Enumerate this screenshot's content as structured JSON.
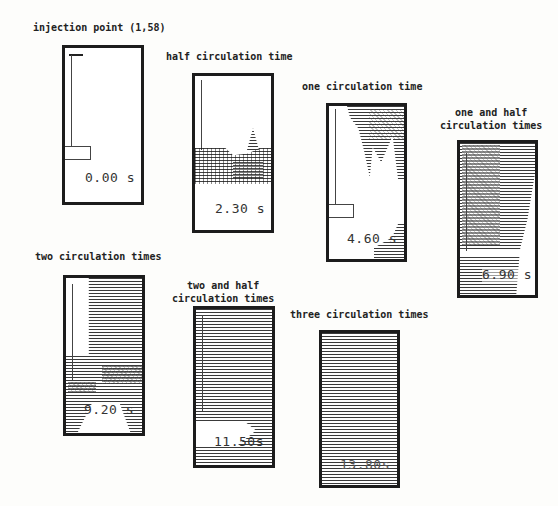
{
  "figure": {
    "type": "time-sequence of tracer dispersion in a vessel",
    "panels": [
      {
        "id": "p0",
        "label": "injection point (1,58)",
        "time": "0.00 s",
        "time_value_s": 0.0,
        "fill_state": "empty"
      },
      {
        "id": "p1",
        "label": "half circulation time",
        "time": "2.30 s",
        "time_value_s": 2.3,
        "fill_state": "lower-middle band"
      },
      {
        "id": "p2",
        "label": "one circulation time",
        "time": "4.60 s",
        "time_value_s": 4.6,
        "fill_state": "upper-right plume and lower-right corner"
      },
      {
        "id": "p3",
        "label": "one and half\ncirculation times",
        "time": "6.90 s",
        "time_value_s": 6.9,
        "fill_state": "mostly filled"
      },
      {
        "id": "p4",
        "label": "two circulation times",
        "time": "9.20 s",
        "time_value_s": 9.2,
        "fill_state": "mostly filled, white upper-left and bottom"
      },
      {
        "id": "p5",
        "label": "two and half\ncirculation times",
        "time": "11.50s",
        "time_value_s": 11.5,
        "fill_state": "nearly full, white bottom-left region"
      },
      {
        "id": "p6",
        "label": "three circulation times",
        "time": "13.80s",
        "time_value_s": 13.8,
        "fill_state": "fully mixed"
      }
    ]
  }
}
